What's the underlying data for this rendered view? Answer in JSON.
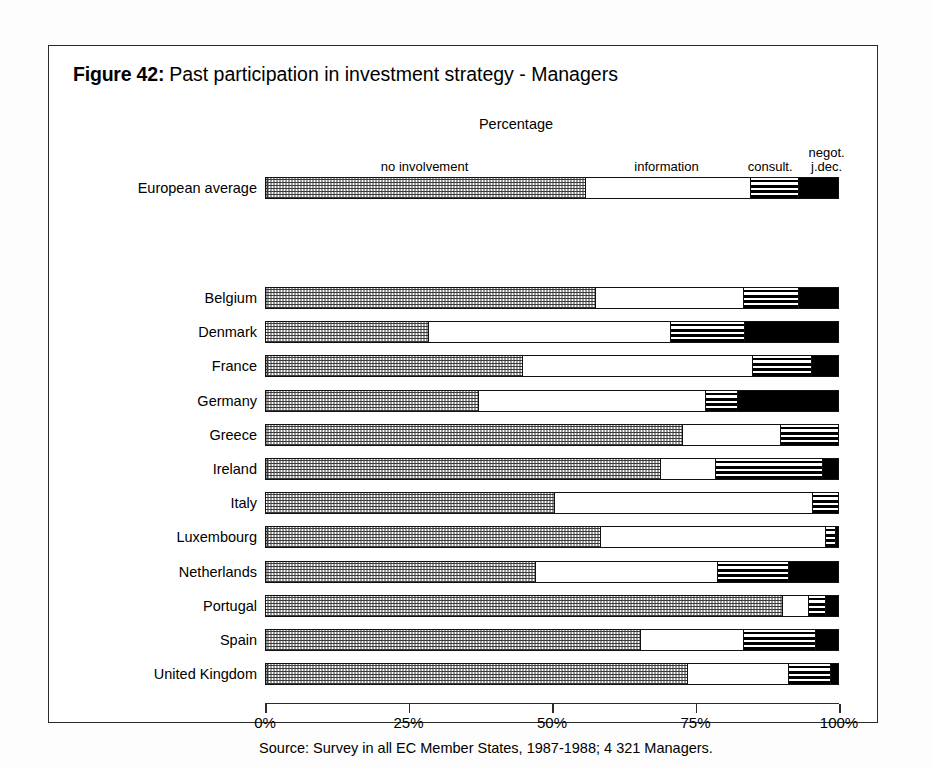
{
  "figure": {
    "label": "Figure 42:",
    "title": "Past participation in investment strategy - Managers",
    "axis_caption": "Percentage",
    "source": "Source: Survey in all EC Member States, 1987-1988; 4 321 Managers."
  },
  "legend": {
    "items": [
      {
        "key": "no_involvement",
        "label": "no involvement",
        "pattern": "checker-dot"
      },
      {
        "key": "information",
        "label": "information",
        "pattern": "white"
      },
      {
        "key": "consultation",
        "label": "consult.",
        "pattern": "horizontal-stripes"
      },
      {
        "key": "negotiation",
        "label": "negot. j.dec.",
        "label_line1": "negot.",
        "label_line2": "j.dec.",
        "pattern": "solid-black"
      }
    ]
  },
  "axis": {
    "ticks": [
      "0%",
      "25%",
      "50%",
      "75%",
      "100%"
    ],
    "tick_values": [
      0,
      25,
      50,
      75,
      100
    ],
    "min": 0,
    "max": 100
  },
  "chart_data": {
    "type": "bar",
    "orientation": "horizontal",
    "stacked": true,
    "percent": true,
    "subtitle": "Percentage",
    "xlabel": "Percentage",
    "ylabel": "",
    "xlim": [
      0,
      100
    ],
    "grid": false,
    "legend_position": "top",
    "categories": [
      "European average",
      "Belgium",
      "Denmark",
      "France",
      "Germany",
      "Greece",
      "Ireland",
      "Italy",
      "Luxembourg",
      "Netherlands",
      "Portugal",
      "Spain",
      "United Kingdom"
    ],
    "series": [
      {
        "name": "no involvement",
        "values": [
          55.6,
          57.3,
          28.2,
          44.6,
          36.9,
          72.5,
          68.6,
          50.2,
          58.2,
          46.9,
          89.9,
          65.2,
          73.3
        ]
      },
      {
        "name": "information",
        "values": [
          28.7,
          25.8,
          42.2,
          40.0,
          39.5,
          17.1,
          9.6,
          44.9,
          39.2,
          31.7,
          4.5,
          17.9,
          17.6
        ]
      },
      {
        "name": "consult.",
        "values": [
          8.4,
          9.6,
          12.9,
          10.3,
          5.7,
          10.4,
          18.6,
          4.9,
          1.7,
          12.4,
          3.0,
          12.5,
          7.3
        ]
      },
      {
        "name": "negot. j.dec.",
        "values": [
          7.3,
          7.3,
          16.7,
          5.1,
          17.9,
          0.0,
          3.2,
          0.0,
          0.9,
          9.0,
          2.6,
          4.4,
          1.8
        ]
      }
    ]
  }
}
